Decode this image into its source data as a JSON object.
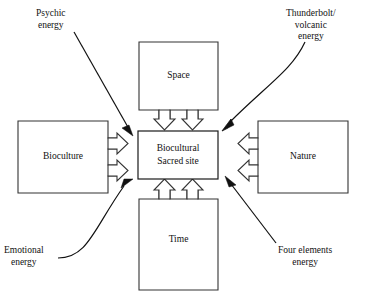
{
  "diagram": {
    "center": {
      "name": "center-node",
      "line1": "Biocultural",
      "line2": "Sacred site"
    },
    "nodes": [
      {
        "id": "space",
        "label": "Space",
        "position": "top"
      },
      {
        "id": "nature",
        "label": "Nature",
        "position": "right"
      },
      {
        "id": "time",
        "label": "Time",
        "position": "bottom"
      },
      {
        "id": "bioculture",
        "label": "Bioculture",
        "position": "left"
      }
    ],
    "captions": [
      {
        "id": "psychic",
        "lines": "Psychic\nenergy",
        "position": "top-left"
      },
      {
        "id": "thunderbolt",
        "lines": "Thunderbolt/\nvolcanic\nenergy",
        "position": "top-right"
      },
      {
        "id": "emotional",
        "lines": "Emotional\nenergy",
        "position": "bottom-left"
      },
      {
        "id": "four-elements",
        "lines": "Four elements\nenergy",
        "position": "bottom-right"
      }
    ],
    "colors": {
      "background": "#ffffff",
      "stroke": "#333333",
      "text": "#111111",
      "arrow_fill": "#111111"
    }
  }
}
